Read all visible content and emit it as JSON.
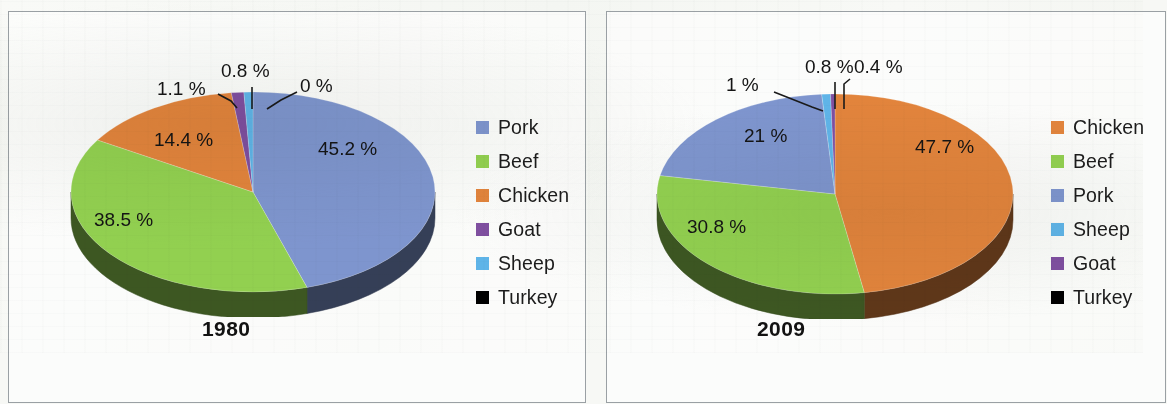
{
  "figure": {
    "background_color": "#f7f8f5",
    "panel_border_color": "#9aa0a4"
  },
  "palette": {
    "pork": "#7e95ce",
    "pork_side": "#2b2f4d",
    "beef": "#92d050",
    "beef_side": "#5f8a2f",
    "chicken": "#e2843c",
    "chicken_side": "#5c3317",
    "goat": "#7f4fa0",
    "goat_side": "#4a2b60",
    "sheep": "#5fb4e8",
    "sheep_side": "#2f6f96",
    "turkey": "#000000",
    "turkey_side": "#000000",
    "label_text": "#141414",
    "leader_line": "#1a1a1a"
  },
  "charts": [
    {
      "id": "chart-1980",
      "title": "1980",
      "legend": [
        {
          "label": "Pork",
          "color": "#7e95ce"
        },
        {
          "label": "Beef",
          "color": "#92d050"
        },
        {
          "label": "Chicken",
          "color": "#e2843c"
        },
        {
          "label": "Goat",
          "color": "#7f4fa0"
        },
        {
          "label": "Sheep",
          "color": "#5fb4e8"
        },
        {
          "label": "Turkey",
          "color": "#000000"
        }
      ],
      "chart_data": {
        "type": "pie",
        "title": "1980",
        "categories": [
          "Pork",
          "Beef",
          "Chicken",
          "Goat",
          "Sheep",
          "Turkey"
        ],
        "values": [
          45.2,
          38.5,
          14.4,
          1.1,
          0.8,
          0.0
        ],
        "labels": [
          "45.2 %",
          "38.5 %",
          "14.4 %",
          "1.1 %",
          "0.8 %",
          "0 %"
        ],
        "unit": "%",
        "colors": [
          "#7e95ce",
          "#92d050",
          "#e2843c",
          "#7f4fa0",
          "#5fb4e8",
          "#000000"
        ],
        "legend_position": "right",
        "three_d": true,
        "start_angle_deg": 0,
        "direction": "clockwise"
      }
    },
    {
      "id": "chart-2009",
      "title": "2009",
      "legend": [
        {
          "label": "Chicken",
          "color": "#e2843c"
        },
        {
          "label": "Beef",
          "color": "#92d050"
        },
        {
          "label": "Pork",
          "color": "#7e95ce"
        },
        {
          "label": "Sheep",
          "color": "#5fb4e8"
        },
        {
          "label": "Goat",
          "color": "#7f4fa0"
        },
        {
          "label": "Turkey",
          "color": "#000000"
        }
      ],
      "chart_data": {
        "type": "pie",
        "title": "2009",
        "categories": [
          "Chicken",
          "Beef",
          "Pork",
          "Sheep",
          "Goat",
          "Turkey"
        ],
        "values": [
          47.7,
          30.8,
          21.0,
          0.8,
          0.4,
          0.0
        ],
        "labels": [
          "47.7 %",
          "30.8 %",
          "21 %",
          "0.8 %",
          "0.4 %",
          "0 %"
        ],
        "unit": "%",
        "colors": [
          "#e2843c",
          "#92d050",
          "#7e95ce",
          "#5fb4e8",
          "#7f4fa0",
          "#000000"
        ],
        "legend_position": "right",
        "three_d": true,
        "start_angle_deg": 0,
        "direction": "clockwise"
      }
    }
  ]
}
